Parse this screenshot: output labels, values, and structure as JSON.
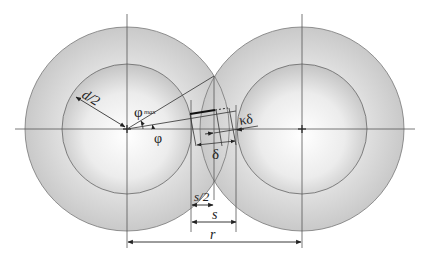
{
  "diagram": {
    "colors": {
      "shell": "#cfcfcf",
      "core_center": "#ffffff",
      "core_edge": "#c8c8c8",
      "line": "#555555",
      "dim_line": "#222222"
    },
    "labels": {
      "radius": "d/2",
      "phi_max": "φ",
      "phi_max_sub": "max",
      "phi": "φ",
      "delta": "δ",
      "kappa_delta": "κδ",
      "s_half": "s/2",
      "s": "s",
      "r": "r"
    }
  }
}
